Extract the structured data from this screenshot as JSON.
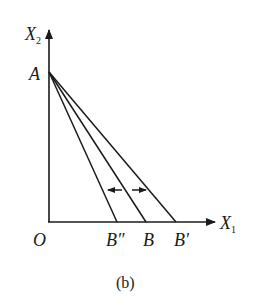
{
  "diagram": {
    "caption": "(b)",
    "axes": {
      "y_label": "X",
      "y_label_sub": "2",
      "x_label": "X",
      "x_label_sub": "1",
      "origin_label": "O"
    },
    "points": {
      "A": "A",
      "B_double_prime": "B″",
      "B": "B",
      "B_prime": "B′"
    },
    "lines": [
      {
        "from": "A",
        "to": "B″"
      },
      {
        "from": "A",
        "to": "B"
      },
      {
        "from": "A",
        "to": "B′"
      }
    ],
    "arrows": [
      {
        "direction": "left",
        "meaning": "rotation toward B″"
      },
      {
        "direction": "right",
        "meaning": "rotation toward B′"
      }
    ],
    "colors": {
      "stroke": "#1a1a1a",
      "background": "#ffffff"
    }
  }
}
